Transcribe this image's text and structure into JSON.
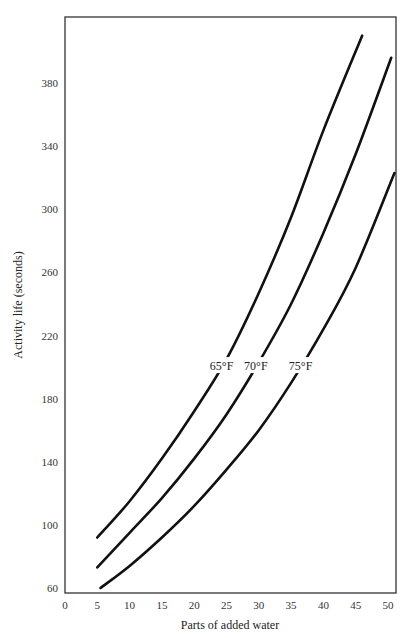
{
  "chart_data": {
    "type": "line",
    "title": "",
    "xlabel": "Parts of added water",
    "ylabel": "Activity life (seconds)",
    "xlim": [
      0,
      51
    ],
    "ylim": [
      60,
      420
    ],
    "x_ticks": [
      0,
      5,
      10,
      15,
      20,
      25,
      30,
      35,
      40,
      45,
      50
    ],
    "y_ticks": [
      60,
      100,
      140,
      180,
      220,
      260,
      300,
      340,
      380
    ],
    "grid": false,
    "legend": "inline labels on curves",
    "series": [
      {
        "name": "65°F",
        "x": [
          5,
          10,
          15,
          20,
          25,
          30,
          35,
          40,
          46
        ],
        "y": [
          92,
          115,
          142,
          172,
          205,
          247,
          295,
          350,
          410
        ]
      },
      {
        "name": "70°F",
        "x": [
          5,
          10,
          15,
          20,
          25,
          30,
          35,
          40,
          45,
          50.5
        ],
        "y": [
          73,
          95,
          117,
          142,
          170,
          203,
          240,
          285,
          335,
          396
        ]
      },
      {
        "name": "75°F",
        "x": [
          5.5,
          10,
          15,
          20,
          25,
          30,
          35,
          40,
          45,
          51
        ],
        "y": [
          60,
          74,
          92,
          112,
          135,
          160,
          190,
          224,
          263,
          323
        ]
      }
    ],
    "curve_label_y": 200
  },
  "axes": {
    "x_label": "Parts of added water",
    "y_label": "Activity life (seconds)"
  },
  "colors": {
    "line": "#111111",
    "axis": "#333333",
    "background": "#ffffff"
  }
}
